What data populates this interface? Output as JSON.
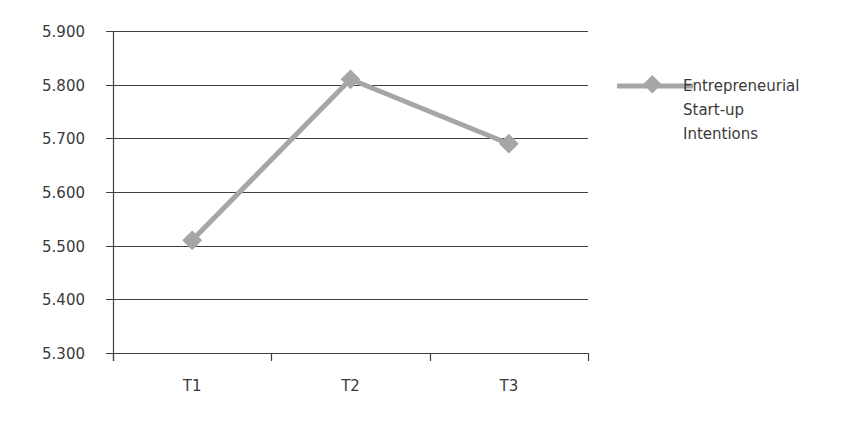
{
  "chart_data": {
    "type": "line",
    "title": "",
    "xlabel": "",
    "ylabel": "",
    "categories": [
      "T1",
      "T2",
      "T3"
    ],
    "series": [
      {
        "name": "Entrepreneurial Start-up Intentions",
        "values": [
          5.51,
          5.81,
          5.69
        ],
        "color": "#a6a6a6",
        "marker": "diamond"
      }
    ],
    "ylim": [
      5.3,
      5.9
    ],
    "yticks": [
      "5.900",
      "5.800",
      "5.700",
      "5.600",
      "5.500",
      "5.400",
      "5.300"
    ],
    "grid": true,
    "legend_position": "right"
  },
  "legend": {
    "lines": [
      "Entrepreneurial",
      "Start-up",
      "Intentions"
    ]
  },
  "colors": {
    "series": "#a6a6a6",
    "grid": "#404040",
    "text": "#3a3a3a"
  }
}
